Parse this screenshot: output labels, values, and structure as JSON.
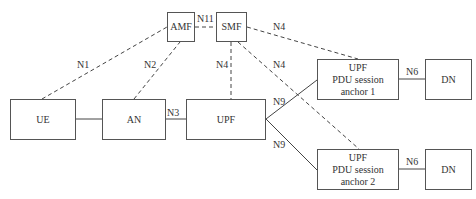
{
  "diagram": {
    "nodes": [
      {
        "id": "ue",
        "label": "UE"
      },
      {
        "id": "an",
        "label": "AN"
      },
      {
        "id": "upf",
        "label": "UPF"
      },
      {
        "id": "amf",
        "label": "AMF"
      },
      {
        "id": "smf",
        "label": "SMF"
      },
      {
        "id": "upf_anchor1",
        "line1": "UPF",
        "line2": "PDU session",
        "line3": "anchor 1"
      },
      {
        "id": "upf_anchor2",
        "line1": "UPF",
        "line2": "PDU session",
        "line3": "anchor 2"
      },
      {
        "id": "dn1",
        "label": "DN"
      },
      {
        "id": "dn2",
        "label": "DN"
      }
    ],
    "edges": [
      {
        "from": "ue",
        "to": "amf",
        "label": "N1",
        "style": "dashed"
      },
      {
        "from": "an",
        "to": "amf",
        "label": "N2",
        "style": "dashed"
      },
      {
        "from": "amf",
        "to": "smf",
        "label": "N11",
        "style": "dashed"
      },
      {
        "from": "smf",
        "to": "upf",
        "label": "N4",
        "style": "dashed"
      },
      {
        "from": "smf",
        "to": "upf_anchor1",
        "label": "N4",
        "style": "dashed"
      },
      {
        "from": "smf",
        "to": "upf_anchor2",
        "label": "N4",
        "style": "dashed"
      },
      {
        "from": "ue",
        "to": "an",
        "label": "",
        "style": "solid"
      },
      {
        "from": "an",
        "to": "upf",
        "label": "N3",
        "style": "solid"
      },
      {
        "from": "upf",
        "to": "upf_anchor1",
        "label": "N9",
        "style": "solid"
      },
      {
        "from": "upf",
        "to": "upf_anchor2",
        "label": "N9",
        "style": "solid"
      },
      {
        "from": "upf_anchor1",
        "to": "dn1",
        "label": "N6",
        "style": "solid"
      },
      {
        "from": "upf_anchor2",
        "to": "dn2",
        "label": "N6",
        "style": "solid"
      }
    ]
  }
}
